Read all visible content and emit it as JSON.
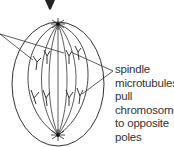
{
  "diagram": {
    "annotation": {
      "lines": [
        "spindle",
        "microtubules",
        "pull",
        "chromosomes",
        "to opposite",
        "poles"
      ],
      "text": "spindle\nmicrotubules\npull\nchromosomes\nto opposite\npoles"
    },
    "colors": {
      "stroke": "#333333",
      "arrow": "#222222",
      "background": "#ffffff"
    },
    "elements": {
      "top_arrow": "arrow pointing down (from previous stage)",
      "cell_membrane": "outer oval",
      "spindle_poles": 2,
      "chromosome_groups": [
        "upper pole group",
        "lower pole group"
      ]
    }
  }
}
